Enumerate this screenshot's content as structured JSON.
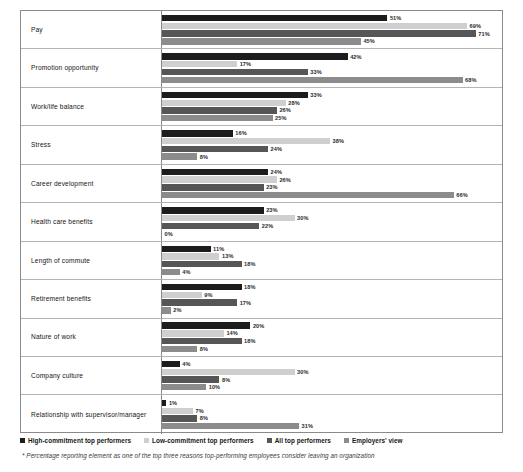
{
  "chart_data": {
    "type": "bar",
    "orientation": "horizontal",
    "title": "",
    "xlabel": "",
    "ylabel": "",
    "xlim": [
      0,
      71
    ],
    "grid": false,
    "legend_position": "bottom-left",
    "categories": [
      "Pay",
      "Promotion opportunity",
      "Work/life balance",
      "Stress",
      "Career development",
      "Health care benefits",
      "Length of commute",
      "Retirement benefits",
      "Nature of work",
      "Company culture",
      "Relationship with supervisor/manager"
    ],
    "series": [
      {
        "name": "High-commitment top performers",
        "color": "#1c1c1c",
        "values": [
          51,
          42,
          33,
          16,
          24,
          23,
          11,
          18,
          20,
          4,
          1
        ],
        "labels": [
          "51%",
          "42%",
          "33%",
          "16%",
          "24%",
          "23%",
          "11%",
          "18%",
          "20%",
          "4%",
          "1%"
        ]
      },
      {
        "name": "Low-commitment top performers",
        "color": "#cfcfcf",
        "values": [
          69,
          17,
          28,
          38,
          26,
          30,
          13,
          9,
          14,
          30,
          7
        ],
        "labels": [
          "69%",
          "17%",
          "28%",
          "38%",
          "26%",
          "30%",
          "13%",
          "9%",
          "14%",
          "30%",
          "7%"
        ]
      },
      {
        "name": "All top performers",
        "color": "#565656",
        "values": [
          71,
          33,
          26,
          24,
          23,
          22,
          18,
          17,
          18,
          13,
          8
        ],
        "labels": [
          "71%",
          "33%",
          "26%",
          "24%",
          "23%",
          "22%",
          "18%",
          "17%",
          "18%",
          "8%",
          "8%"
        ]
      },
      {
        "name": "Employers' view",
        "color": "#8c8c8c",
        "values": [
          45,
          68,
          25,
          8,
          66,
          0,
          4,
          2,
          8,
          10,
          31
        ],
        "labels": [
          "45%",
          "68%",
          "25%",
          "8%",
          "66%",
          "0%",
          "4%",
          "2%",
          "8%",
          "10%",
          "31%"
        ]
      }
    ]
  },
  "legend": {
    "items": [
      {
        "label": "High-commitment top performers",
        "color": "#1c1c1c"
      },
      {
        "label": "Low-commitment top performers",
        "color": "#cfcfcf"
      },
      {
        "label": "All top performers",
        "color": "#565656"
      },
      {
        "label": "Employers' view",
        "color": "#8c8c8c"
      }
    ]
  },
  "footnote": "* Percentage reporting element as one of the top three reasons top-performing employees consider leaving an organization"
}
